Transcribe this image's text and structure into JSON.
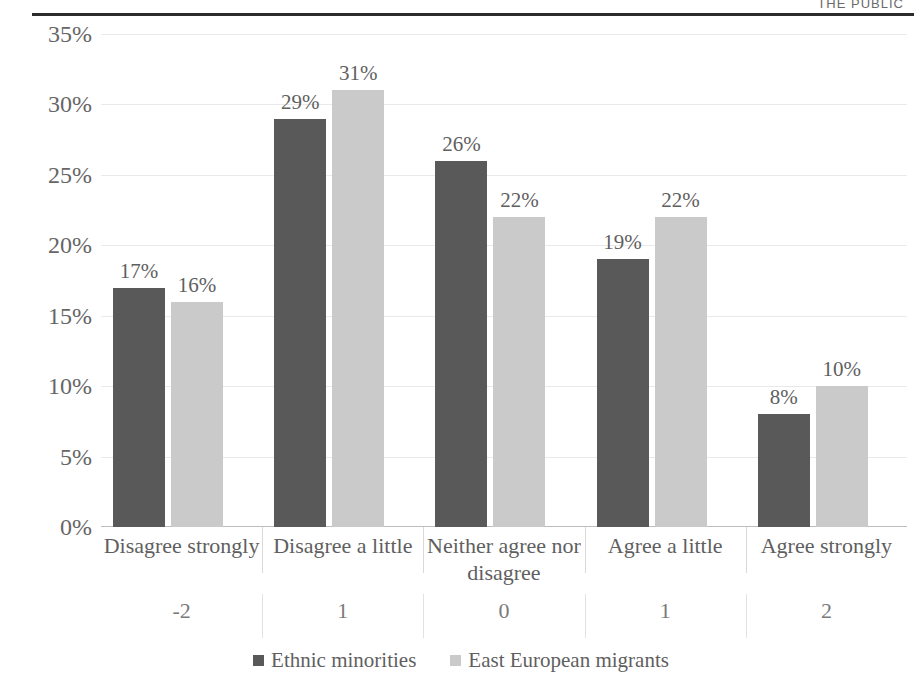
{
  "page_header": "THE PUBLIC",
  "legend": {
    "position": "bottom-center",
    "entries": [
      {
        "label": "Ethnic minorities",
        "color": "#595959"
      },
      {
        "label": "East European migrants",
        "color": "#cacaca"
      }
    ]
  },
  "chart_data": {
    "type": "bar",
    "title": "",
    "xlabel": "",
    "ylabel": "",
    "ylim": [
      0,
      35
    ],
    "ytick_labels": [
      "0%",
      "5%",
      "10%",
      "15%",
      "20%",
      "25%",
      "30%",
      "35%"
    ],
    "ytick_values": [
      0,
      5,
      10,
      15,
      20,
      25,
      30,
      35
    ],
    "grid": true,
    "categories": [
      "Disagree strongly",
      "Disagree a little",
      "Neither agree nor disagree",
      "Agree a little",
      "Agree strongly"
    ],
    "secondary_axis_labels": [
      "-2",
      "1",
      "0",
      "1",
      "2"
    ],
    "series": [
      {
        "name": "Ethnic minorities",
        "color": "#595959",
        "values": [
          17,
          29,
          26,
          19,
          8
        ],
        "data_labels": [
          "17%",
          "29%",
          "26%",
          "19%",
          "8%"
        ]
      },
      {
        "name": "East European migrants",
        "color": "#cacaca",
        "values": [
          16,
          31,
          22,
          22,
          10
        ],
        "data_labels": [
          "16%",
          "31%",
          "22%",
          "22%",
          "10%"
        ]
      }
    ]
  }
}
